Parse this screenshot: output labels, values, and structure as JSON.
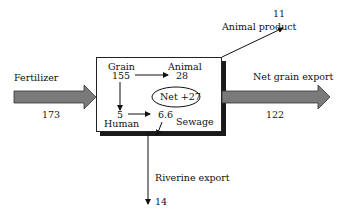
{
  "diagram": {
    "type": "flow-budget",
    "inputs": [
      {
        "label": "Fertilizer",
        "value": "173"
      }
    ],
    "outputs": [
      {
        "label": "Animal product",
        "value": "11"
      },
      {
        "label": "Net grain export",
        "value": "122"
      },
      {
        "label": "Riverine export",
        "value": "14"
      }
    ],
    "internal": {
      "grain": {
        "label": "Grain",
        "value": "155"
      },
      "animal": {
        "label": "Animal",
        "value": "28"
      },
      "human": {
        "label": "Human",
        "value": "5"
      },
      "sewage": {
        "label": "Sewage",
        "value": "6.6"
      },
      "net": "Net +27"
    },
    "colors": {
      "arrow_fill": "#7a7a7a",
      "arrow_stroke": "#333333",
      "shadow": "#1a1a1a",
      "line": "#111111"
    }
  }
}
